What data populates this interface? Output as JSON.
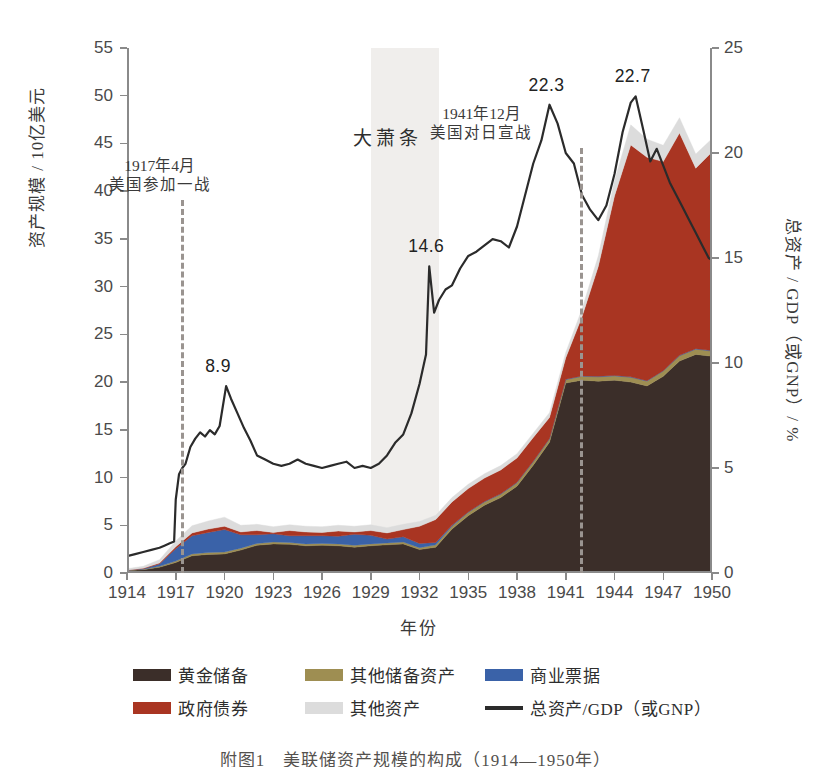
{
  "figure": {
    "caption": "附图1　美联储资产规模的构成（1914—1950年）"
  },
  "axes": {
    "x_title": "年份",
    "y_left_title": "资产规模 / 10亿美元",
    "y_right_title": "总资产 / GDP（或GNP）/ %",
    "x_ticks": [
      "1914",
      "1917",
      "1920",
      "1923",
      "1926",
      "1929",
      "1932",
      "1935",
      "1938",
      "1941",
      "1944",
      "1947",
      "1950"
    ],
    "y_left_ticks": [
      "0",
      "5",
      "10",
      "15",
      "20",
      "25",
      "30",
      "35",
      "40",
      "45",
      "50",
      "55"
    ],
    "y_right_ticks": [
      "0",
      "5",
      "10",
      "15",
      "20",
      "25"
    ]
  },
  "annotations": {
    "depression": "大萧条",
    "event_ww1": {
      "line1": "1917年4月",
      "line2": "美国参加一战"
    },
    "event_ww2": {
      "line1": "1941年12月",
      "line2": "美国对日宣战"
    },
    "peaks": [
      {
        "label": "8.9",
        "year": 1920.1,
        "value": 8.9
      },
      {
        "label": "14.6",
        "year": 1932.6,
        "value": 14.6
      },
      {
        "label": "22.3",
        "year": 1940.0,
        "value": 22.3
      },
      {
        "label": "22.7",
        "year": 1945.3,
        "value": 22.7
      }
    ]
  },
  "legend": {
    "row1": [
      {
        "name": "黄金储备",
        "color": "#3b2e29",
        "type": "area"
      },
      {
        "name": "其他储备资产",
        "color": "#9e8e52",
        "type": "area"
      },
      {
        "name": "商业票据",
        "color": "#3a62a8",
        "type": "area"
      }
    ],
    "row2": [
      {
        "name": "政府债券",
        "color": "#a93522",
        "type": "area"
      },
      {
        "name": "其他资产",
        "color": "#dcdcdc",
        "type": "area"
      },
      {
        "name": "总资产/GDP（或GNP）",
        "color": "#2b2b2b",
        "type": "line"
      }
    ]
  },
  "chart_data": {
    "type": "area",
    "title": "",
    "xlabel": "年份",
    "ylabel": "资产规模 / 10亿美元",
    "ylabel_secondary": "总资产 / GDP（或GNP）/ %",
    "xlim": [
      1914,
      1950
    ],
    "ylim": [
      0,
      55
    ],
    "ylim_secondary": [
      0,
      25
    ],
    "grid": false,
    "legend_position": "bottom",
    "shaded_regions": [
      {
        "label": "大萧条",
        "x0": 1929.0,
        "x1": 1933.2,
        "color": "#f0eeec"
      }
    ],
    "event_lines": [
      {
        "label": "1917年4月 美国参加一战",
        "x": 1917.3
      },
      {
        "label": "1941年12月 美国对日宣战",
        "x": 1941.9
      }
    ],
    "x": [
      1914,
      1915,
      1916,
      1917,
      1918,
      1919,
      1920,
      1921,
      1922,
      1923,
      1924,
      1925,
      1926,
      1927,
      1928,
      1929,
      1930,
      1931,
      1932,
      1933,
      1934,
      1935,
      1936,
      1937,
      1938,
      1939,
      1940,
      1941,
      1942,
      1943,
      1944,
      1945,
      1946,
      1947,
      1948,
      1949,
      1950
    ],
    "series": [
      {
        "name": "黄金储备",
        "color": "#3b2e29",
        "values": [
          0.25,
          0.35,
          0.6,
          1.1,
          1.8,
          1.95,
          2.0,
          2.4,
          2.9,
          3.05,
          3.0,
          2.85,
          2.9,
          2.85,
          2.7,
          2.85,
          2.95,
          3.05,
          2.45,
          2.7,
          4.6,
          6.0,
          7.1,
          7.9,
          9.1,
          11.3,
          13.7,
          19.9,
          20.2,
          20.1,
          20.2,
          20.0,
          19.6,
          20.6,
          22.2,
          22.9,
          22.7
        ]
      },
      {
        "name": "其他储备资产",
        "color": "#9e8e52",
        "values": [
          0.05,
          0.05,
          0.1,
          0.15,
          0.2,
          0.2,
          0.2,
          0.2,
          0.2,
          0.2,
          0.2,
          0.2,
          0.2,
          0.2,
          0.2,
          0.2,
          0.2,
          0.2,
          0.2,
          0.25,
          0.3,
          0.35,
          0.35,
          0.35,
          0.35,
          0.35,
          0.35,
          0.35,
          0.4,
          0.45,
          0.45,
          0.5,
          0.5,
          0.55,
          0.55,
          0.55,
          0.55
        ]
      },
      {
        "name": "商业票据",
        "color": "#3a62a8",
        "values": [
          0.0,
          0.05,
          0.25,
          1.3,
          1.9,
          2.1,
          2.35,
          1.4,
          0.9,
          0.85,
          0.7,
          0.85,
          0.8,
          0.8,
          1.15,
          0.9,
          0.4,
          0.55,
          0.45,
          0.25,
          0.1,
          0.05,
          0.05,
          0.05,
          0.05,
          0.05,
          0.05,
          0.05,
          0.05,
          0.05,
          0.05,
          0.05,
          0.05,
          0.05,
          0.05,
          0.05,
          0.05
        ]
      },
      {
        "name": "政府债券",
        "color": "#a93522",
        "values": [
          0.0,
          0.05,
          0.1,
          0.2,
          0.3,
          0.35,
          0.35,
          0.3,
          0.45,
          0.15,
          0.55,
          0.4,
          0.35,
          0.55,
          0.25,
          0.5,
          0.65,
          0.75,
          1.8,
          2.4,
          2.45,
          2.45,
          2.45,
          2.5,
          2.55,
          2.5,
          2.2,
          2.25,
          6.2,
          11.5,
          18.8,
          24.3,
          23.4,
          21.9,
          23.3,
          18.9,
          20.8
        ]
      },
      {
        "name": "其他资产",
        "color": "#dcdcdc",
        "values": [
          0.15,
          0.2,
          0.35,
          0.6,
          0.75,
          0.85,
          0.95,
          0.7,
          0.65,
          0.6,
          0.6,
          0.6,
          0.6,
          0.6,
          0.6,
          0.6,
          0.55,
          0.55,
          0.5,
          0.45,
          0.45,
          0.45,
          0.45,
          0.45,
          0.45,
          0.45,
          0.5,
          0.55,
          0.8,
          1.1,
          1.6,
          2.1,
          1.9,
          1.7,
          1.6,
          1.5,
          1.4
        ]
      }
    ],
    "line_series": {
      "name": "总资产/GDP（或GNP）",
      "color": "#2b2b2b",
      "axis": "secondary",
      "unit": "%",
      "x": [
        1914.0,
        1914.5,
        1915.0,
        1915.5,
        1916.0,
        1916.3,
        1916.6,
        1916.9,
        1917.0,
        1917.2,
        1917.4,
        1917.6,
        1917.9,
        1918.2,
        1918.5,
        1918.8,
        1919.1,
        1919.4,
        1919.7,
        1920.1,
        1920.4,
        1920.8,
        1921.2,
        1921.6,
        1922.0,
        1922.5,
        1923.0,
        1923.5,
        1924.0,
        1924.5,
        1925.0,
        1925.5,
        1926.0,
        1926.5,
        1927.0,
        1927.5,
        1928.0,
        1928.5,
        1929.0,
        1929.5,
        1930.0,
        1930.5,
        1931.0,
        1931.5,
        1932.0,
        1932.4,
        1932.6,
        1932.9,
        1933.2,
        1933.6,
        1934.0,
        1934.5,
        1935.0,
        1935.5,
        1936.0,
        1936.5,
        1937.0,
        1937.5,
        1938.0,
        1938.5,
        1939.0,
        1939.5,
        1940.0,
        1940.5,
        1941.0,
        1941.5,
        1942.0,
        1942.5,
        1943.0,
        1943.5,
        1944.0,
        1944.5,
        1945.0,
        1945.3,
        1945.8,
        1946.2,
        1946.6,
        1947.0,
        1947.4,
        1947.8,
        1948.2,
        1948.6,
        1949.0,
        1949.4,
        1949.8,
        1950.0
      ],
      "y": [
        0.8,
        0.9,
        1.0,
        1.1,
        1.2,
        1.3,
        1.4,
        1.5,
        3.5,
        4.7,
        5.0,
        5.2,
        6.0,
        6.4,
        6.7,
        6.5,
        6.8,
        6.6,
        7.0,
        8.9,
        8.3,
        7.6,
        6.9,
        6.3,
        5.6,
        5.4,
        5.2,
        5.1,
        5.2,
        5.4,
        5.2,
        5.1,
        5.0,
        5.1,
        5.2,
        5.3,
        5.0,
        5.1,
        5.0,
        5.2,
        5.6,
        6.2,
        6.6,
        7.6,
        9.0,
        10.4,
        14.6,
        12.4,
        13.0,
        13.5,
        13.7,
        14.5,
        15.1,
        15.3,
        15.6,
        15.9,
        15.8,
        15.5,
        16.5,
        18.0,
        19.5,
        20.6,
        22.3,
        21.4,
        20.0,
        19.5,
        18.0,
        17.3,
        16.8,
        17.5,
        19.0,
        21.0,
        22.4,
        22.7,
        21.0,
        19.6,
        20.2,
        19.4,
        18.6,
        18.0,
        17.4,
        16.8,
        16.2,
        15.6,
        15.0,
        14.9
      ]
    }
  }
}
